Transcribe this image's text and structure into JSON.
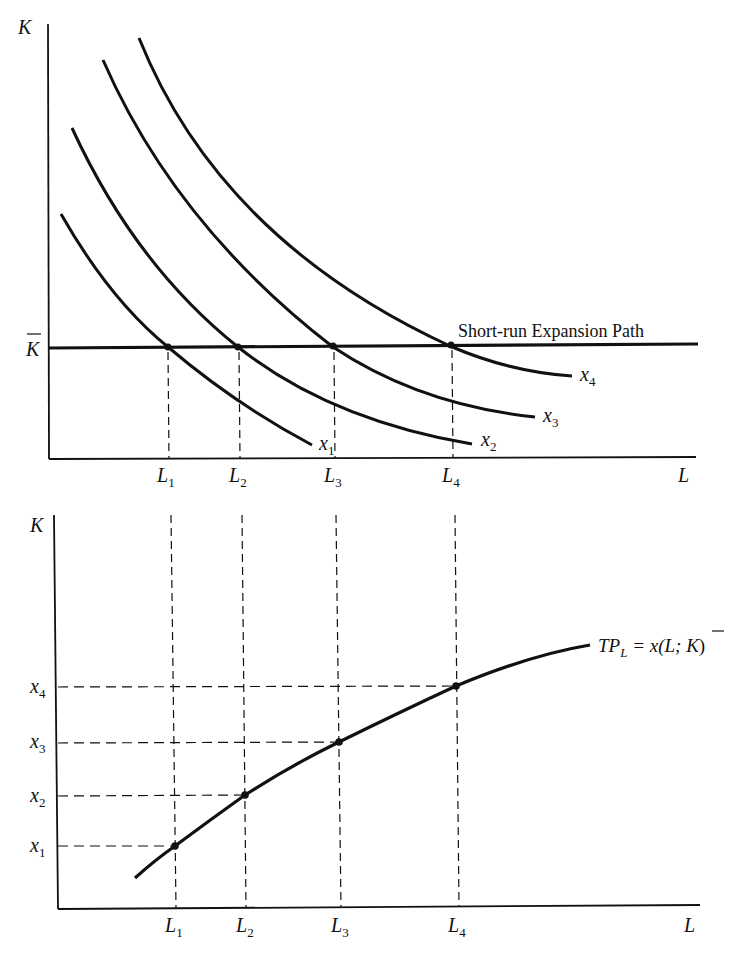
{
  "top_panel": {
    "y_axis_label": "K",
    "x_axis_label": "L",
    "kbar_label": "K",
    "expansion_path_label": "Short-run Expansion Path",
    "isoquants": [
      {
        "name": "x",
        "sub": "1"
      },
      {
        "name": "x",
        "sub": "2"
      },
      {
        "name": "x",
        "sub": "3"
      },
      {
        "name": "x",
        "sub": "4"
      }
    ],
    "l_ticks": [
      {
        "name": "L",
        "sub": "1"
      },
      {
        "name": "L",
        "sub": "2"
      },
      {
        "name": "L",
        "sub": "3"
      },
      {
        "name": "L",
        "sub": "4"
      }
    ]
  },
  "bottom_panel": {
    "y_axis_label": "K",
    "x_axis_label": "L",
    "curve_label": {
      "tp": "TP",
      "sub": "L",
      "eq": " = x(L; ",
      "kbar": "K",
      "close": ")"
    },
    "x_ticks": [
      {
        "name": "x",
        "sub": "1"
      },
      {
        "name": "x",
        "sub": "2"
      },
      {
        "name": "x",
        "sub": "3"
      },
      {
        "name": "x",
        "sub": "4"
      }
    ],
    "l_ticks": [
      {
        "name": "L",
        "sub": "1"
      },
      {
        "name": "L",
        "sub": "2"
      },
      {
        "name": "L",
        "sub": "3"
      },
      {
        "name": "L",
        "sub": "4"
      }
    ]
  },
  "colors": {
    "ink": "#111111",
    "background": "#ffffff"
  }
}
